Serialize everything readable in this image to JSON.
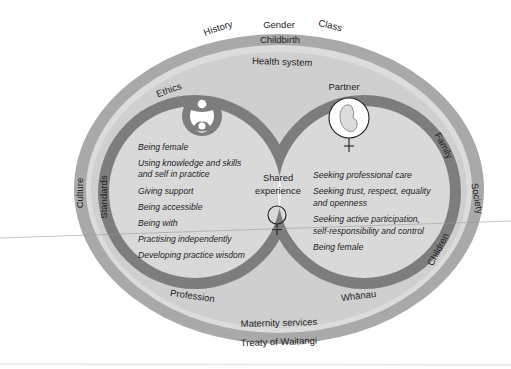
{
  "diagram": {
    "outer_context": {
      "top": [
        "History",
        "Gender",
        "Class"
      ],
      "left": "Culture",
      "right": "Society"
    },
    "outer_band": {
      "top": "Childbirth",
      "bottom": "Treaty of Waitangi"
    },
    "inner_field": {
      "top": "Health system",
      "bottom": "Maternity services"
    },
    "left_ring": {
      "labels": {
        "top": "Ethics",
        "left": "Standards",
        "bottom": "Profession"
      },
      "icon": "midwife-woman-icon",
      "items": [
        "Being female",
        "Using knowledge and skills",
        "and self in practice",
        "Giving support",
        "Being accessible",
        "Being with",
        "Practising independently",
        "Developing practice wisdom"
      ]
    },
    "right_ring": {
      "labels": {
        "top": "Partner",
        "right_upper": "Family",
        "right_lower": "Children",
        "bottom": "Whānau"
      },
      "icon": "fetus-female-symbol-icon",
      "items": [
        "Seeking professional care",
        "Seeking trust, respect, equality",
        "and openness",
        "Seeking active participation,",
        "self-responsibility and control",
        "Being female"
      ]
    },
    "intersection": {
      "line1": "Shared",
      "line2": "experience",
      "icon": "female-symbol-icon"
    },
    "colors": {
      "outer_band": "#a9a9a9",
      "inner_band": "#dcdcdc",
      "field": "#cfcfcf",
      "ring": "#7d7d7d",
      "ring_interior": "#d9d9d9",
      "lens": "#f4f4f4",
      "background": "#ffffff"
    }
  }
}
